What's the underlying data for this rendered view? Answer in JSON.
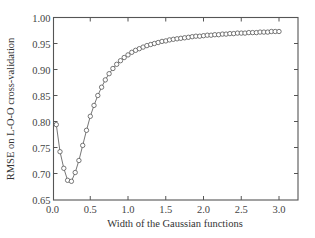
{
  "chart_data": {
    "type": "line",
    "title": "",
    "xlabel": "Width of the Gaussian functions",
    "ylabel": "RMSE on  L-O-O cross-validation",
    "xlim": [
      0.0,
      3.25
    ],
    "ylim": [
      0.65,
      1.0
    ],
    "xticks": [
      "0.0",
      "0.5",
      "1.0",
      "1.5",
      "2.0",
      "2.5",
      "3.0"
    ],
    "yticks": [
      "0.65",
      "0.70",
      "0.75",
      "0.80",
      "0.85",
      "0.90",
      "0.95",
      "1.00"
    ],
    "grid": false,
    "legend": null,
    "marker": "open-circle",
    "series": [
      {
        "name": "RMSE",
        "x": [
          0.05,
          0.1,
          0.15,
          0.2,
          0.25,
          0.3,
          0.35,
          0.4,
          0.45,
          0.5,
          0.55,
          0.6,
          0.65,
          0.7,
          0.75,
          0.8,
          0.85,
          0.9,
          0.95,
          1.0,
          1.05,
          1.1,
          1.15,
          1.2,
          1.25,
          1.3,
          1.35,
          1.4,
          1.45,
          1.5,
          1.55,
          1.6,
          1.65,
          1.7,
          1.75,
          1.8,
          1.85,
          1.9,
          1.95,
          2.0,
          2.05,
          2.1,
          2.15,
          2.2,
          2.25,
          2.3,
          2.35,
          2.4,
          2.45,
          2.5,
          2.55,
          2.6,
          2.65,
          2.7,
          2.75,
          2.8,
          2.85,
          2.9,
          2.95,
          3.0
        ],
        "y": [
          0.794,
          0.742,
          0.71,
          0.687,
          0.685,
          0.702,
          0.725,
          0.754,
          0.783,
          0.81,
          0.831,
          0.85,
          0.866,
          0.88,
          0.892,
          0.902,
          0.91,
          0.917,
          0.923,
          0.928,
          0.933,
          0.937,
          0.94,
          0.943,
          0.946,
          0.948,
          0.95,
          0.952,
          0.954,
          0.955,
          0.957,
          0.958,
          0.959,
          0.96,
          0.961,
          0.962,
          0.963,
          0.964,
          0.964,
          0.965,
          0.966,
          0.966,
          0.967,
          0.967,
          0.968,
          0.968,
          0.969,
          0.969,
          0.97,
          0.97,
          0.97,
          0.971,
          0.971,
          0.971,
          0.972,
          0.972,
          0.972,
          0.973,
          0.973,
          0.973
        ]
      }
    ]
  },
  "colors": {
    "axis": "#555555",
    "line": "#666666",
    "marker_stroke": "#555555",
    "marker_fill": "#ffffff"
  }
}
